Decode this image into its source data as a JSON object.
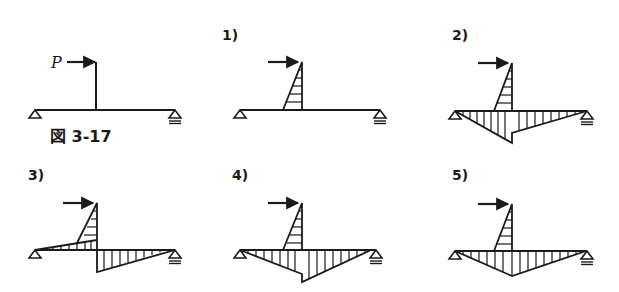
{
  "figure": {
    "caption": "図 3-17",
    "load_label": "P",
    "stroke_color": "#1a1a1a",
    "background": "#ffffff"
  },
  "panels": [
    {
      "id": "original",
      "label": "",
      "description": "Simply supported beam with vertical post; horizontal load P at top of post"
    },
    {
      "id": "1",
      "label": "1)",
      "description": "Moment diagram in post only (triangle, horizontal hatching)"
    },
    {
      "id": "2",
      "label": "2)",
      "description": "Post triangle plus beam diagram below; left segment deeper than right at post"
    },
    {
      "id": "3",
      "label": "3)",
      "description": "Post triangle; beam diagram above on left, below on right (antisymmetric jump)"
    },
    {
      "id": "4",
      "label": "4)",
      "description": "Post triangle plus beam diagram below; right segment deeper than left at post"
    },
    {
      "id": "5",
      "label": "5)",
      "description": "Post triangle plus single triangular beam diagram below, apex at post"
    }
  ]
}
